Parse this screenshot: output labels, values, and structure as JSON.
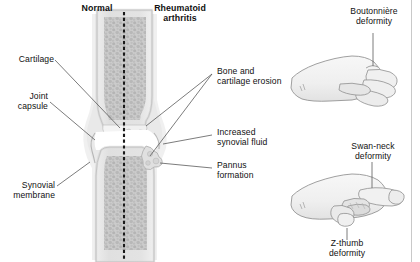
{
  "figure": {
    "title_normal": "Normal",
    "title_ra": "Rheumatoid\narthritis",
    "width": 420,
    "height": 262
  },
  "labels": {
    "left": [
      {
        "id": "cartilage",
        "text": "Cartilage"
      },
      {
        "id": "joint-capsule",
        "text": "Joint\ncapsule"
      },
      {
        "id": "synovial-membrane",
        "text": "Synovial\nmembrane"
      }
    ],
    "right": [
      {
        "id": "bone-cartilage-erosion",
        "text": "Bone and\ncartilage erosion"
      },
      {
        "id": "increased-synovial-fluid",
        "text": "Increased\nsynovial fluid"
      },
      {
        "id": "pannus-formation",
        "text": "Pannus\nformation"
      }
    ],
    "hands": [
      {
        "id": "boutonniere-deformity",
        "text": "Boutonnière\ndeformity"
      },
      {
        "id": "swan-neck-deformity",
        "text": "Swan-neck\ndeformity"
      },
      {
        "id": "z-thumb-deformity",
        "text": "Z-thumb\ndeformity"
      }
    ]
  },
  "colors": {
    "bone_cortex": "#e4e4e4",
    "bone_trabecular": "#c3c3c3",
    "cartilage": "#efefef",
    "capsule": "#e8e8e8",
    "joint_space": "#ffffff",
    "outline": "#9a9a9a",
    "midline": "#1a1a1a",
    "leader": "#5c5c5c",
    "text": "#111111",
    "hand_fill": "#f2f2f2",
    "hand_shade": "#d8d8d8",
    "hand_outline": "#8a8a8a",
    "border": "#c9c9c9"
  },
  "anatomy": {
    "midline_style": "dashed-vertical",
    "midline_x": 124,
    "panels": {
      "left_half": "Normal joint: intact cartilage, normal joint space, smooth synovial membrane",
      "right_half": "Rheumatoid arthritis: bone and cartilage erosion, increased synovial fluid, pannus formation"
    },
    "hand_top": "Side view of hand showing boutonnière deformity at the proximal interphalangeal joint",
    "hand_bottom": "Side view of hand showing swan-neck deformity of the fingers and Z-thumb deformity"
  }
}
